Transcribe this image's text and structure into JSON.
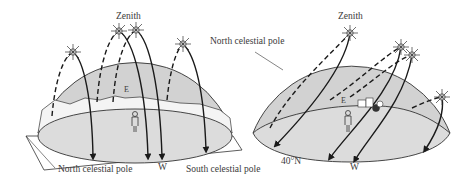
{
  "left_panel": {
    "description": "Celestial sphere seen from the equator",
    "labels": {
      "zenith": "Zenith",
      "east": "E",
      "west": "W",
      "north_pole": "North celestial pole",
      "south_pole": "South celestial pole"
    }
  },
  "right_panel": {
    "description": "Celestial sphere seen from latitude 40°N",
    "labels": {
      "zenith": "Zenith",
      "east": "E",
      "west": "W",
      "north_pole": "North celestial pole",
      "latitude": "40°N"
    }
  },
  "colors": {
    "dome_fill": "#d4d4d4",
    "ground_fill": "#dcdcdc",
    "line": "#1a1a1a",
    "text": "#3a3a3a"
  }
}
